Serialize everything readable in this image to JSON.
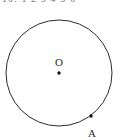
{
  "figure": {
    "kind": "geometry-diagram",
    "title_fragment": "10. 1 2 3 4 5 6",
    "background_color": "#ffffff",
    "stroke_color": "#2b2b2b",
    "label_color": "#2b2b2b"
  },
  "circle": {
    "name": "circle-O",
    "center_x": 59,
    "center_y": 73,
    "radius": 53,
    "stroke_width": 1
  },
  "points": [
    {
      "id": "O",
      "label": "O",
      "role": "center",
      "dot_x": 59,
      "dot_y": 73,
      "dot_radius": 1.7,
      "label_x": 59,
      "label_y": 66
    },
    {
      "id": "A",
      "label": "A",
      "role": "on-circle",
      "dot_x": 91,
      "dot_y": 116,
      "dot_radius": 1.7,
      "label_x": 92,
      "label_y": 137
    }
  ]
}
